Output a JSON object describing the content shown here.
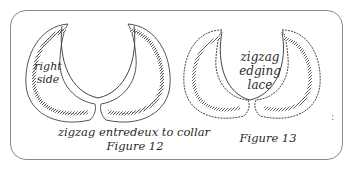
{
  "figure12": {
    "side_label_line1": "right",
    "side_label_line2": "side",
    "caption": "zigzag entredeux to collar",
    "figure_label": "Figure 12"
  },
  "figure13": {
    "label_line1": "zigzag",
    "label_line2": "edging",
    "label_line3": "lace",
    "figure_label": "Figure 13"
  },
  "colors": {
    "line": "#3a3a3a",
    "frame": "#8a8a8a",
    "background": "#ffffff"
  },
  "margin_mark": ":"
}
